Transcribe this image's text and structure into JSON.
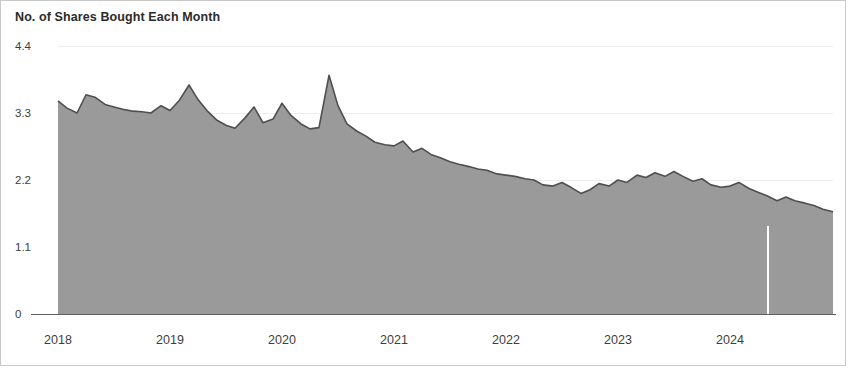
{
  "chart_data": {
    "type": "area",
    "title": "No. of Shares Bought Each Month",
    "xlabel": "",
    "ylabel": "",
    "ylim": [
      0,
      4.4
    ],
    "yticks": [
      "0",
      "1.1",
      "2.2",
      "3.3",
      "4.4"
    ],
    "ytick_values": [
      0,
      1.1,
      2.2,
      3.3,
      4.4
    ],
    "xticks": [
      "2018",
      "2019",
      "2020",
      "2021",
      "2022",
      "2023",
      "2024"
    ],
    "xtick_values": [
      2018,
      2019,
      2020,
      2021,
      2022,
      2023,
      2024
    ],
    "grid": true,
    "legend": false,
    "fill_color": "#9a9a9a",
    "line_color": "#4f4f4f",
    "annotations": [
      {
        "name": "forecast-divider",
        "type": "vline",
        "x": 2024.33,
        "color": "#ffffff"
      }
    ],
    "x": [
      2018.0,
      2018.08,
      2018.17,
      2018.25,
      2018.33,
      2018.42,
      2018.5,
      2018.58,
      2018.67,
      2018.75,
      2018.83,
      2018.92,
      2019.0,
      2019.08,
      2019.17,
      2019.25,
      2019.33,
      2019.42,
      2019.5,
      2019.58,
      2019.67,
      2019.75,
      2019.83,
      2019.92,
      2020.0,
      2020.08,
      2020.17,
      2020.25,
      2020.33,
      2020.42,
      2020.5,
      2020.58,
      2020.67,
      2020.75,
      2020.83,
      2020.92,
      2021.0,
      2021.08,
      2021.17,
      2021.25,
      2021.33,
      2021.42,
      2021.5,
      2021.58,
      2021.67,
      2021.75,
      2021.83,
      2021.92,
      2022.0,
      2022.08,
      2022.17,
      2022.25,
      2022.33,
      2022.42,
      2022.5,
      2022.58,
      2022.67,
      2022.75,
      2022.83,
      2022.92,
      2023.0,
      2023.08,
      2023.17,
      2023.25,
      2023.33,
      2023.42,
      2023.5,
      2023.58,
      2023.67,
      2023.75,
      2023.83,
      2023.92,
      2024.0,
      2024.08,
      2024.17,
      2024.25,
      2024.33,
      2024.42,
      2024.5,
      2024.58,
      2024.67,
      2024.75,
      2024.83,
      2024.92
    ],
    "values": [
      3.5,
      3.38,
      3.3,
      3.6,
      3.56,
      3.44,
      3.4,
      3.36,
      3.33,
      3.32,
      3.3,
      3.42,
      3.34,
      3.5,
      3.76,
      3.52,
      3.34,
      3.18,
      3.1,
      3.05,
      3.22,
      3.4,
      3.14,
      3.2,
      3.46,
      3.26,
      3.12,
      3.04,
      3.06,
      3.92,
      3.42,
      3.12,
      3.0,
      2.92,
      2.82,
      2.78,
      2.76,
      2.84,
      2.66,
      2.72,
      2.62,
      2.56,
      2.5,
      2.46,
      2.42,
      2.38,
      2.36,
      2.3,
      2.28,
      2.26,
      2.22,
      2.2,
      2.12,
      2.1,
      2.16,
      2.08,
      1.98,
      2.04,
      2.14,
      2.1,
      2.2,
      2.16,
      2.28,
      2.24,
      2.32,
      2.26,
      2.34,
      2.26,
      2.18,
      2.22,
      2.12,
      2.08,
      2.1,
      2.16,
      2.06,
      2.0,
      1.94,
      1.86,
      1.92,
      1.86,
      1.82,
      1.78,
      1.72,
      1.68
    ]
  }
}
